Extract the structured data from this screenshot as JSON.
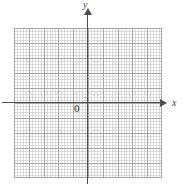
{
  "figure": {
    "kind": "cartesian-coordinate-grid",
    "title": "",
    "background_color": "#ffffff"
  },
  "axes": {
    "x": {
      "label": "x",
      "arrow": "right",
      "color": "#4d4d4d"
    },
    "y": {
      "label": "y",
      "arrow": "up",
      "color": "#4d4d4d"
    },
    "origin_label": "0"
  },
  "chart_data": {
    "type": "scatter",
    "title": "",
    "xlabel": "x",
    "ylabel": "y",
    "x": [],
    "y": [],
    "series": [],
    "annotations": [
      "0"
    ],
    "xlim": [
      -5,
      5
    ],
    "ylim": [
      -5,
      5
    ],
    "grid": true,
    "major_gridlines_x": 10,
    "major_gridlines_y": 10,
    "minor_subdivisions": 5,
    "legend": null,
    "legend_position": "none",
    "grid_major_color": "#a6a6a6",
    "grid_minor_color": "#c9c9c9"
  }
}
